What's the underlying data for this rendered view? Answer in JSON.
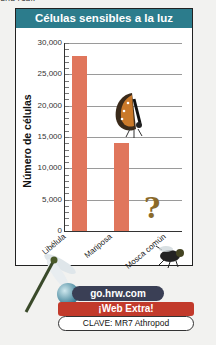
{
  "page": {
    "top_text_fragment": "una real."
  },
  "chart_data": {
    "type": "bar",
    "title": "Células sensibles a la luz",
    "xlabel": "",
    "ylabel": "Número de células",
    "categories": [
      "Libélula",
      "Mariposa",
      "Mosca común"
    ],
    "values": [
      28000,
      14000,
      null
    ],
    "unknown_marker": "?",
    "ylim": [
      0,
      30000
    ],
    "yticks": [
      "30,000",
      "25,000",
      "20,000",
      "15,000",
      "10,000",
      "5,000",
      "0"
    ],
    "grid": true,
    "bar_color": "#e0765c"
  },
  "illustrations": {
    "butterfly": "butterfly-illustration",
    "dragonfly": "dragonfly-illustration",
    "fly": "housefly-illustration"
  },
  "web_extra": {
    "url": "go.hrw.com",
    "label": "¡Web Extra!",
    "keyword": "CLAVE: MR7 Athropod"
  },
  "colors": {
    "title_bg": "#2c7c8c",
    "bar": "#e0765c",
    "web_extra_bg": "#c23a2b",
    "url_bg": "#3a3f55"
  }
}
